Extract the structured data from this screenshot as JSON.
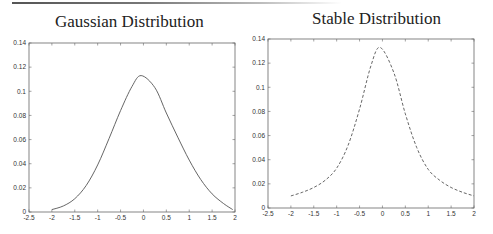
{
  "chart_data": [
    {
      "type": "line",
      "title": "Gaussian Distribution",
      "xlabel": "",
      "ylabel": "",
      "xlim": [
        -2.5,
        2
      ],
      "ylim": [
        0,
        0.14
      ],
      "x_ticks": [
        "-2.5",
        "-2",
        "-1.5",
        "-1",
        "-0.5",
        "0",
        "0.5",
        "1",
        "1.5",
        "2"
      ],
      "y_ticks": [
        "0",
        "0.02",
        "0.04",
        "0.06",
        "0.08",
        "0.1",
        "0.12",
        "0.14"
      ],
      "grid": false,
      "line_style": "solid",
      "x": [
        -2,
        -1.75,
        -1.5,
        -1.25,
        -1,
        -0.75,
        -0.5,
        -0.25,
        -0.05,
        0.25,
        0.5,
        0.75,
        1,
        1.25,
        1.5,
        1.75,
        1.95
      ],
      "values": [
        0.002,
        0.005,
        0.011,
        0.022,
        0.039,
        0.061,
        0.084,
        0.104,
        0.113,
        0.103,
        0.082,
        0.062,
        0.043,
        0.027,
        0.015,
        0.007,
        0.002
      ]
    },
    {
      "type": "line",
      "title": "Stable Distribution",
      "xlabel": "",
      "ylabel": "",
      "xlim": [
        -2.5,
        2
      ],
      "ylim": [
        0,
        0.14
      ],
      "x_ticks": [
        "-2.5",
        "-2",
        "-1.5",
        "-1",
        "-0.5",
        "0",
        "0.5",
        "1",
        "1.5",
        "2"
      ],
      "y_ticks": [
        "0",
        "0.02",
        "0.04",
        "0.06",
        "0.08",
        "0.1",
        "0.12",
        "0.14"
      ],
      "grid": false,
      "line_style": "dashed",
      "x": [
        -2,
        -1.75,
        -1.5,
        -1.25,
        -1,
        -0.75,
        -0.5,
        -0.25,
        -0.05,
        0.25,
        0.5,
        0.75,
        1,
        1.25,
        1.5,
        1.75,
        2
      ],
      "values": [
        0.01,
        0.013,
        0.017,
        0.023,
        0.033,
        0.052,
        0.082,
        0.118,
        0.133,
        0.112,
        0.078,
        0.05,
        0.032,
        0.023,
        0.017,
        0.013,
        0.01
      ]
    }
  ]
}
